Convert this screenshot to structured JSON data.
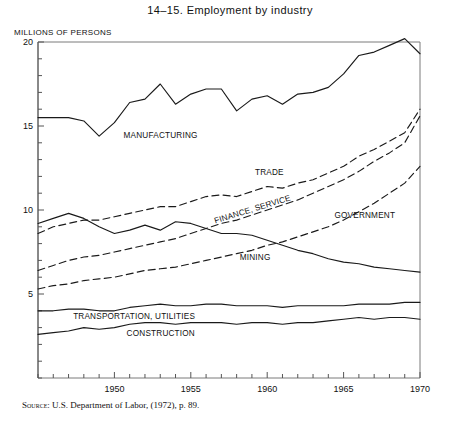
{
  "title": "14–15.   Employment by industry",
  "y_axis_title": "MILLIONS OF PERSONS",
  "source": {
    "label": "Source",
    "text": ": U.S. Department of Labor, (1972), p. 89."
  },
  "axis": {
    "x_ticks": [
      "1950",
      "1955",
      "1960",
      "1965",
      "1970"
    ],
    "y_ticks": [
      "5",
      "10",
      "15",
      "20"
    ]
  },
  "series_labels": {
    "manufacturing": "MANUFACTURING",
    "trade": "TRADE",
    "finance_service": "FINANCE, SERVICE",
    "government": "GOVERNMENT",
    "mining": "MINING",
    "transportation": "TRANSPORTATION, UTILITIES",
    "construction": "CONSTRUCTION"
  },
  "chart_data": {
    "type": "line",
    "title": "14–15.   Employment by industry",
    "subtitle": "",
    "xlabel": "",
    "ylabel": "MILLIONS OF PERSONS",
    "xlim": [
      1945,
      1970
    ],
    "ylim": [
      0,
      20
    ],
    "x_ticks_major": [
      1950,
      1955,
      1960,
      1965,
      1970
    ],
    "y_ticks_major": [
      5,
      10,
      15,
      20
    ],
    "y_ticks_minor_step": 1,
    "x_ticks_minor_step": 1,
    "grid": false,
    "legend": "inline-labels",
    "x": [
      1945,
      1946,
      1947,
      1948,
      1949,
      1950,
      1951,
      1952,
      1953,
      1954,
      1955,
      1956,
      1957,
      1958,
      1959,
      1960,
      1961,
      1962,
      1963,
      1964,
      1965,
      1966,
      1967,
      1968,
      1969,
      1970
    ],
    "series": [
      {
        "name": "MANUFACTURING",
        "style": "solid",
        "values": [
          15.5,
          15.5,
          15.5,
          15.3,
          14.4,
          15.2,
          16.4,
          16.6,
          17.5,
          16.3,
          16.9,
          17.2,
          17.2,
          15.9,
          16.6,
          16.8,
          16.3,
          16.9,
          17.0,
          17.3,
          18.1,
          19.2,
          19.4,
          19.8,
          20.2,
          19.3
        ]
      },
      {
        "name": "TRADE",
        "style": "dashed",
        "values": [
          8.6,
          9.0,
          9.2,
          9.4,
          9.4,
          9.6,
          9.8,
          10.0,
          10.2,
          10.2,
          10.5,
          10.8,
          10.9,
          10.8,
          11.1,
          11.4,
          11.3,
          11.6,
          11.8,
          12.2,
          12.6,
          13.2,
          13.6,
          14.1,
          14.6,
          16.0
        ]
      },
      {
        "name": "FINANCE, SERVICE",
        "style": "dashed",
        "values": [
          6.4,
          6.7,
          7.0,
          7.2,
          7.3,
          7.5,
          7.7,
          7.9,
          8.1,
          8.3,
          8.6,
          8.9,
          9.2,
          9.4,
          9.7,
          10.0,
          10.3,
          10.6,
          11.0,
          11.4,
          11.8,
          12.3,
          12.9,
          13.4,
          14.0,
          15.6
        ]
      },
      {
        "name": "GOVERNMENT",
        "style": "dashed",
        "values": [
          5.3,
          5.5,
          5.6,
          5.8,
          5.9,
          6.0,
          6.2,
          6.4,
          6.5,
          6.6,
          6.8,
          7.0,
          7.2,
          7.4,
          7.6,
          7.9,
          8.1,
          8.4,
          8.7,
          9.0,
          9.4,
          9.9,
          10.4,
          11.0,
          11.6,
          12.6
        ]
      },
      {
        "name": "MINING",
        "style": "solid",
        "values": [
          9.2,
          9.5,
          9.8,
          9.5,
          9.0,
          8.6,
          8.8,
          9.1,
          8.8,
          9.3,
          9.2,
          8.9,
          8.6,
          8.6,
          8.5,
          8.2,
          7.9,
          7.6,
          7.4,
          7.1,
          6.9,
          6.8,
          6.6,
          6.5,
          6.4,
          6.3
        ]
      },
      {
        "name": "TRANSPORTATION, UTILITIES",
        "style": "solid",
        "values": [
          4.0,
          4.0,
          4.1,
          4.1,
          4.0,
          4.0,
          4.2,
          4.3,
          4.4,
          4.3,
          4.3,
          4.4,
          4.4,
          4.3,
          4.3,
          4.3,
          4.2,
          4.3,
          4.3,
          4.3,
          4.3,
          4.4,
          4.4,
          4.4,
          4.5,
          4.5
        ]
      },
      {
        "name": "CONSTRUCTION",
        "style": "solid",
        "values": [
          2.6,
          2.7,
          2.8,
          3.0,
          2.9,
          3.0,
          3.2,
          3.3,
          3.3,
          3.2,
          3.3,
          3.3,
          3.3,
          3.2,
          3.3,
          3.3,
          3.2,
          3.3,
          3.3,
          3.4,
          3.5,
          3.6,
          3.5,
          3.6,
          3.6,
          3.5
        ]
      }
    ],
    "annotations": [
      {
        "text": "MANUFACTURING",
        "x": 1950.6,
        "y": 14.3
      },
      {
        "text": "TRADE",
        "x": 1959.2,
        "y": 12.1
      },
      {
        "text": "FINANCE, SERVICE",
        "x": 1956.6,
        "y": 9.2,
        "rotate": -17
      },
      {
        "text": "GOVERNMENT",
        "x": 1964.4,
        "y": 9.5
      },
      {
        "text": "MINING",
        "x": 1958.2,
        "y": 7.0
      },
      {
        "text": "TRANSPORTATION, UTILITIES",
        "x": 1947.3,
        "y": 3.5
      },
      {
        "text": "CONSTRUCTION",
        "x": 1950.8,
        "y": 2.5
      }
    ]
  }
}
